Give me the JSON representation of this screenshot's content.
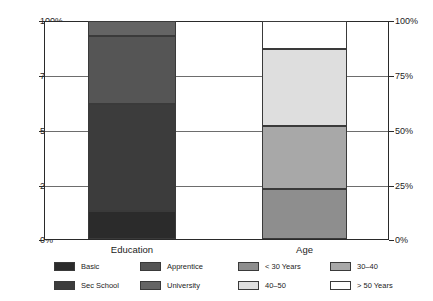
{
  "chart_data": {
    "type": "bar",
    "subtype": "stacked-100-percent",
    "title": "",
    "xlabel": "",
    "ylabel": "",
    "categories": [
      "Education",
      "Age"
    ],
    "ylim": [
      0,
      100
    ],
    "ytick_labels": [
      "0%",
      "25%",
      "50%",
      "75%",
      "100%"
    ],
    "ytick_values": [
      0,
      25,
      50,
      75,
      100
    ],
    "grid": true,
    "grid_axis": "y",
    "dual_y_axis": true,
    "legend_position": "bottom",
    "units": "percent",
    "groups": [
      {
        "category": "Education",
        "legend_title": "",
        "series": [
          {
            "name": "Basic",
            "value": 13,
            "start": 0,
            "end": 13,
            "color": "#2b2b2b"
          },
          {
            "name": "Sec School",
            "value": 49,
            "start": 13,
            "end": 62,
            "color": "#3c3c3c"
          },
          {
            "name": "Apprentice",
            "value": 31,
            "start": 62,
            "end": 93,
            "color": "#555555"
          },
          {
            "name": "University",
            "value": 7,
            "start": 93,
            "end": 100,
            "color": "#646464"
          }
        ]
      },
      {
        "category": "Age",
        "legend_title": "",
        "series": [
          {
            "name": "< 30 Years",
            "value": 23,
            "start": 0,
            "end": 23,
            "color": "#8e8e8e"
          },
          {
            "name": "30–40",
            "value": 29,
            "start": 23,
            "end": 52,
            "color": "#a8a8a8"
          },
          {
            "name": "40–50",
            "value": 35,
            "start": 52,
            "end": 87,
            "color": "#dedede"
          },
          {
            "name": "> 50 Years",
            "value": 13,
            "start": 87,
            "end": 100,
            "color": "#ffffff"
          }
        ]
      }
    ]
  },
  "axis": {
    "left": {
      "t100": "100%",
      "t75": "75%",
      "t50": "50%",
      "t25": "25%",
      "t0": "0%"
    },
    "right": {
      "t100": "100%",
      "t75": "75%",
      "t50": "50%",
      "t25": "25%",
      "t0": "0%"
    }
  },
  "xaxis": {
    "label_education": "Education",
    "label_age": "Age"
  },
  "legend": {
    "items": [
      {
        "label": "Basic",
        "color": "#2b2b2b"
      },
      {
        "label": "Apprentice",
        "color": "#555555"
      },
      {
        "label": "< 30 Years",
        "color": "#8e8e8e"
      },
      {
        "label": "30–40",
        "color": "#a8a8a8"
      },
      {
        "label": "Sec School",
        "color": "#3c3c3c"
      },
      {
        "label": "University",
        "color": "#646464"
      },
      {
        "label": "40–50",
        "color": "#dedede"
      },
      {
        "label": "> 50 Years",
        "color": "#ffffff"
      }
    ]
  },
  "colors": {
    "frame": "#2a2a2a",
    "gridline": "#6d6d6d",
    "text": "#1c1c1c",
    "background": "#ffffff"
  }
}
